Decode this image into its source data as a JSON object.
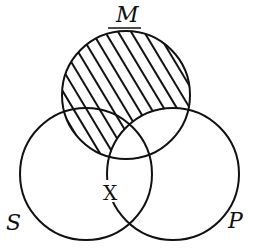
{
  "diagram": {
    "type": "venn",
    "sets": [
      {
        "id": "M",
        "label": "M",
        "underlined": true
      },
      {
        "id": "S",
        "label": "S"
      },
      {
        "id": "P",
        "label": "P"
      }
    ],
    "shaded_region": "M minus P",
    "marker": {
      "label": "X",
      "region": "on the S–P boundary below M"
    },
    "colors": {
      "stroke": "#111111",
      "background": "#ffffff"
    }
  }
}
